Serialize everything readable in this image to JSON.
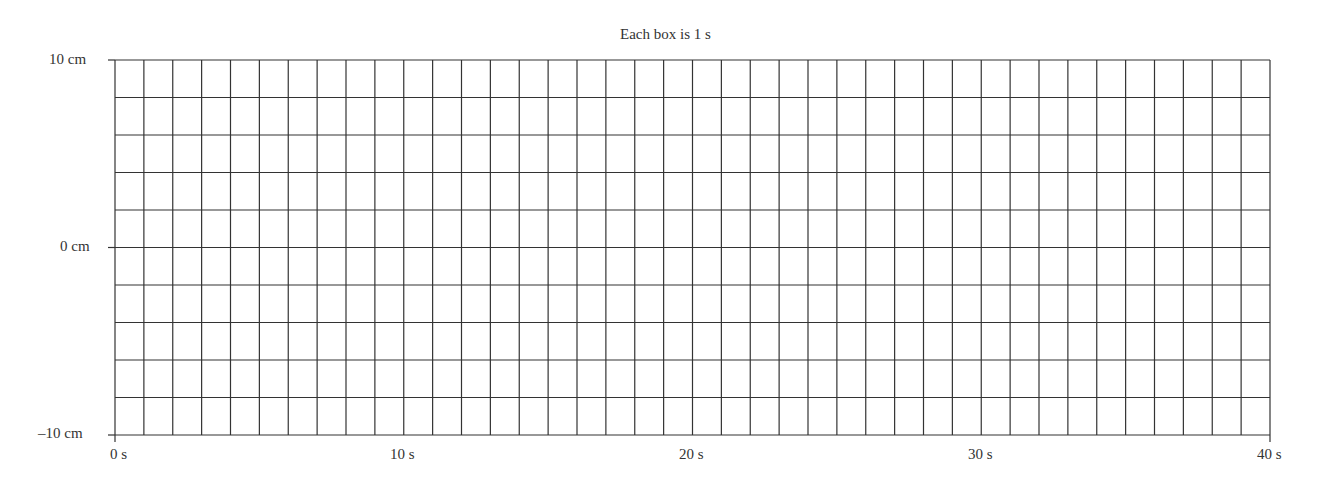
{
  "chart_data": {
    "type": "line",
    "title": "Each box is 1 s",
    "xlabel": "",
    "ylabel": "",
    "xlim": [
      0,
      40
    ],
    "ylim": [
      -10,
      10
    ],
    "x_ticks": [
      {
        "value": 0,
        "label": "0 s"
      },
      {
        "value": 10,
        "label": "10 s"
      },
      {
        "value": 20,
        "label": "20 s"
      },
      {
        "value": 30,
        "label": "30 s"
      },
      {
        "value": 40,
        "label": "40 s"
      }
    ],
    "y_ticks": [
      {
        "value": 10,
        "label": "10 cm"
      },
      {
        "value": 0,
        "label": "0 cm"
      },
      {
        "value": -10,
        "label": "–10 cm"
      }
    ],
    "grid": {
      "columns": 40,
      "rows": 10,
      "on": true
    },
    "series": [],
    "legend": null
  },
  "colors": {
    "grid": "#333333",
    "text": "#333333",
    "background": "#ffffff"
  }
}
